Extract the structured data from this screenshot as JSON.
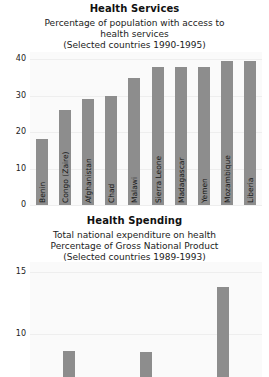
{
  "chart_data": [
    {
      "type": "bar",
      "title": "Health Services",
      "subtitle_lines": [
        "Percentage of population with access to",
        "health services",
        "(Selected countries 1990-1995)"
      ],
      "categories": [
        "Benin",
        "Congo (Zaire)",
        "Afghanistan",
        "Chad",
        "Malawi",
        "Sierra Leone",
        "Madagascar",
        "Yemen",
        "Mozambique",
        "Liberia"
      ],
      "values": [
        18,
        26,
        29,
        30,
        35,
        38,
        38,
        38,
        39.5,
        39.5
      ],
      "xlabel": "",
      "ylabel": "",
      "ylim": [
        0,
        42
      ],
      "yticks": [
        0,
        10,
        20,
        30,
        40
      ],
      "grid": true,
      "bar_color": "#8d8d8d",
      "legend": "none"
    },
    {
      "type": "bar",
      "title": "Health Spending",
      "subtitle_lines": [
        "Total national expenditure on health",
        "Percentage of Gross National Product",
        "(Selected countries 1989-1993)"
      ],
      "categories": [
        "",
        "",
        ""
      ],
      "values": [
        8.6,
        8.5,
        13.8
      ],
      "xlabel": "",
      "ylabel": "",
      "ylim": [
        6.5,
        15.8
      ],
      "yticks": [
        10,
        15
      ],
      "grid": true,
      "bar_color": "#8d8d8d",
      "legend": "none",
      "note": "bottom of axis cropped by screenshot edge"
    }
  ]
}
